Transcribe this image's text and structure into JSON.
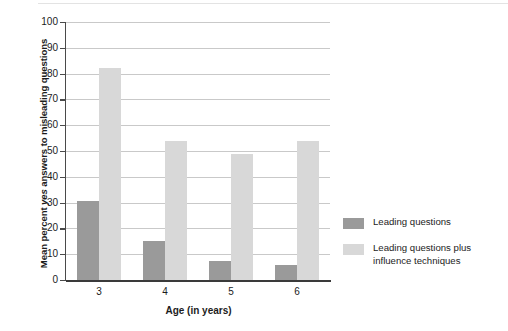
{
  "chart_data": {
    "type": "bar",
    "title": "",
    "categories": [
      "3",
      "4",
      "5",
      "6"
    ],
    "series": [
      {
        "name": "Leading questions",
        "color": "#9a9a9a",
        "values": [
          30.5,
          15,
          7.5,
          6
        ]
      },
      {
        "name": "Leading questions plus influence techniques",
        "color": "#d8d8d8",
        "values": [
          82,
          54,
          49,
          54
        ]
      }
    ],
    "xlabel": "Age (in years)",
    "ylabel": "Mean percent yes answers to misleading questions",
    "ylabel_parts": {
      "before": "Mean percent ",
      "italic": "yes",
      "after": " answers to misleading questions"
    },
    "ylim": [
      0,
      100
    ],
    "ytick_step": 10,
    "ytick_labels": [
      "100",
      "90",
      "80",
      "70",
      "60",
      "50",
      "40",
      "30",
      "20",
      "10",
      "0"
    ],
    "grid": true,
    "legend_position": "right"
  },
  "legend": {
    "items": [
      {
        "label": "Leading questions",
        "color": "#9a9a9a"
      },
      {
        "label": "Leading questions plus influence techniques",
        "color": "#d8d8d8"
      }
    ]
  }
}
